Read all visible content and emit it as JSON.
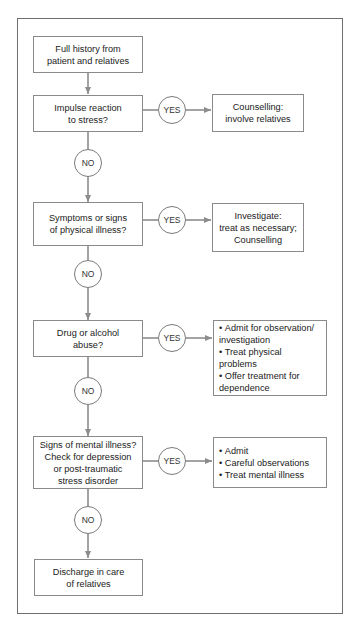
{
  "flowchart": {
    "start": {
      "lines": [
        "Full history from",
        "patient and relatives"
      ]
    },
    "decisions": [
      {
        "question": [
          "Impulse reaction",
          "to stress?"
        ],
        "yes_label": "YES",
        "yes_action": {
          "type": "text",
          "lines": [
            "Counselling:",
            "involve relatives"
          ]
        },
        "no_label": "NO"
      },
      {
        "question": [
          "Symptoms or signs",
          "of physical illness?"
        ],
        "yes_label": "YES",
        "yes_action": {
          "type": "text",
          "lines": [
            "Investigate:",
            "treat as necessary;",
            "Counselling"
          ]
        },
        "no_label": "NO"
      },
      {
        "question": [
          "Drug or alcohol",
          "abuse?"
        ],
        "yes_label": "YES",
        "yes_action": {
          "type": "list",
          "items": [
            "Admit for observation/ investigation",
            "Treat physical problems",
            "Offer treatment for dependence"
          ]
        },
        "no_label": "NO"
      },
      {
        "question": [
          "Signs of mental illness?",
          "Check for depression",
          "or post-traumatic",
          "stress disorder"
        ],
        "yes_label": "YES",
        "yes_action": {
          "type": "list",
          "items": [
            "Admit",
            "Careful observations",
            "Treat mental illness"
          ]
        },
        "no_label": "NO"
      }
    ],
    "end": {
      "lines": [
        "Discharge in care",
        "of relatives"
      ]
    },
    "colors": {
      "line": "#8c8c8c",
      "border": "#8a8a8a",
      "frame": "#6f6f6f"
    }
  }
}
